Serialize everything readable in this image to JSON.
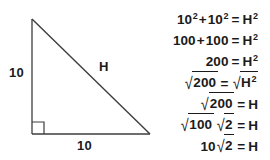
{
  "figure": {
    "shape": "right-triangle",
    "right_angle_marker": true,
    "stroke_color": "#3d3d3d",
    "labels": {
      "leg_vertical": "10",
      "leg_horizontal": "10",
      "hypotenuse": "H"
    },
    "vertices": {
      "apex": [
        32,
        19
      ],
      "right_angle": [
        32,
        134
      ],
      "bottom_right": [
        150,
        134
      ]
    }
  },
  "equations": {
    "lines": [
      {
        "id": "line-1",
        "plain": "10^2 + 10^2 = H^2",
        "base_a": "10",
        "exp_a": "2",
        "operator": "+",
        "base_b": "10",
        "exp_b": "2",
        "equals": "=",
        "rhs_base": "H",
        "rhs_exp": "2"
      },
      {
        "id": "line-2",
        "plain": "100 + 100 = H^2",
        "base_a": "100",
        "operator": "+",
        "base_b": "100",
        "equals": "=",
        "rhs_base": "H",
        "rhs_exp": "2"
      },
      {
        "id": "line-3",
        "plain": "200 = H^2",
        "base_a": "200",
        "equals": "=",
        "rhs_base": "H",
        "rhs_exp": "2"
      },
      {
        "id": "line-4",
        "plain": "sqrt(200) = sqrt(H^2)",
        "lhs_radicand": "200",
        "equals": "=",
        "rhs_radicand_base": "H",
        "rhs_radicand_exp": "2"
      },
      {
        "id": "line-5",
        "plain": "sqrt(200) = H",
        "lhs_radicand": "200",
        "equals": "=",
        "rhs_base": "H"
      },
      {
        "id": "line-6",
        "plain": "sqrt(100) sqrt(2) = H",
        "lhs_radicand_a": "100",
        "lhs_radicand_b": "2",
        "equals": "=",
        "rhs_base": "H"
      },
      {
        "id": "line-7",
        "plain": "10 sqrt(2) = H",
        "coefficient": "10",
        "lhs_radicand": "2",
        "equals": "=",
        "rhs_base": "H"
      }
    ],
    "radical_glyph": "√",
    "text_color": "#1a1a1a"
  },
  "background_color": "#ffffff"
}
